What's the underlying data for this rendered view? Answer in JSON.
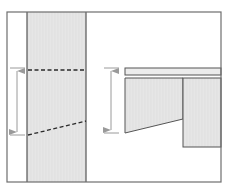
{
  "diagram": {
    "colors": {
      "background": "#ffffff",
      "frame": "#6e6e6e",
      "fill": "#e4e4e4",
      "fill_light": "#ececec",
      "outline": "#555555",
      "dash": "#2a2a2a",
      "arrow": "#9a9a9a"
    },
    "frame": {
      "x": 7,
      "y": 12,
      "width": 214,
      "height": 170
    },
    "left_panel": {
      "strip": {
        "x": 27,
        "y": 12,
        "width": 59,
        "height": 170
      },
      "top_dashed_line": {
        "x1": 28,
        "y1": 70,
        "x2": 86,
        "y2": 70
      },
      "bottom_dashed_line": {
        "x1": 28,
        "y1": 135,
        "x2": 86,
        "y2": 121
      },
      "dimension_arrow": {
        "x": 17,
        "y_top": 68,
        "y_bottom": 135,
        "tick_x1": 10,
        "tick_x2": 25
      }
    },
    "right_panel": {
      "top_bar": {
        "x": 125,
        "y": 68,
        "width": 96,
        "height": 7
      },
      "left_block": {
        "points": "125,78 183,78 183,119 125,133"
      },
      "right_block": {
        "x": 183,
        "y": 78,
        "width": 38,
        "height": 69
      },
      "dimension_arrow": {
        "x": 111,
        "y_top": 68,
        "y_bottom": 133,
        "tick_x1": 104,
        "tick_x2": 119
      }
    }
  }
}
